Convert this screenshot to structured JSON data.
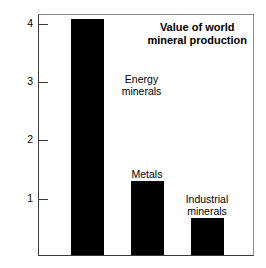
{
  "chart_data": {
    "type": "bar",
    "title": "Value of world mineral production",
    "title_lines": [
      "Value of world",
      "mineral production"
    ],
    "xlabel": "",
    "ylabel": "Value (trillions of dollars)",
    "categories": [
      "Energy minerals",
      "Metals",
      "Industrial minerals"
    ],
    "category_lines": [
      [
        "Energy",
        "minerals"
      ],
      [
        "Metals"
      ],
      [
        "Industrial",
        "minerals"
      ]
    ],
    "values": [
      4.05,
      1.27,
      0.63
    ],
    "ylim": [
      0,
      4.15
    ],
    "yticks": [
      1,
      2,
      3,
      4
    ],
    "ytick_labels": [
      "1",
      "2",
      "3",
      "4"
    ],
    "grid": false,
    "legend": "none",
    "bar_color": "#000000",
    "axis_color": "#3a3a3a",
    "background_color": "#ffffff"
  }
}
